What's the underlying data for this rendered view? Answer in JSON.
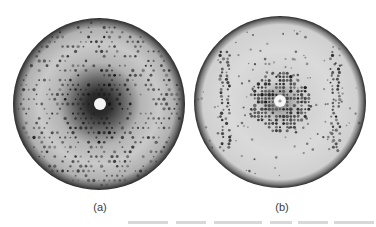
{
  "figure": {
    "panels": [
      {
        "id": "a",
        "label": "(a)",
        "description": "diffraction pattern with dark diffuse halo around center",
        "center": [
          99,
          104
        ],
        "radius": 86,
        "beam_stop_radius": 6,
        "colors": {
          "rim": "#2a2a2a",
          "outer": "#b9b9b9",
          "mid": "#d2d2d2",
          "inner_dark": "#3a3a3a",
          "spot": "#1e1e1e"
        }
      },
      {
        "id": "b",
        "label": "(b)",
        "description": "diffraction pattern with light background, concentrated central spots and vertical spot streaks",
        "center": [
          280,
          102
        ],
        "radius": 86,
        "beam_stop_radius": 6,
        "colors": {
          "rim": "#2a2a2a",
          "outer": "#d6d6d6",
          "mid": "#dcdcdc",
          "inner_dark": "#6a6a6a",
          "spot": "#1e1e1e"
        }
      }
    ],
    "caption_cutoff": "partially visible caption line (illegible)"
  }
}
